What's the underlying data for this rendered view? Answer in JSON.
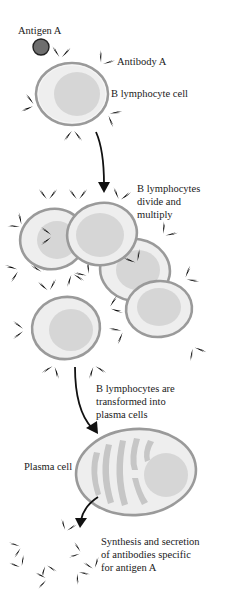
{
  "diagram": {
    "labels": {
      "antigen": "Antigen A",
      "antibody": "Antibody A",
      "b_cell": "B lymphocyte cell",
      "divide": [
        "B lymphocytes",
        "divide and",
        "multiply"
      ],
      "transform": [
        "B lymphocytes are",
        "transformed into",
        "plasma cells"
      ],
      "plasma_cell": "Plasma cell",
      "synthesis": [
        "Synthesis and secretion",
        "of antibodies specific",
        "for antigen A"
      ]
    },
    "stages": [
      {
        "name": "antigen-binding",
        "description": "Antigen A binds Antibody A on B lymphocyte cell"
      },
      {
        "name": "proliferation",
        "description": "B lymphocytes divide and multiply"
      },
      {
        "name": "differentiation",
        "description": "B lymphocytes are transformed into plasma cells"
      },
      {
        "name": "secretion",
        "description": "Synthesis and secretion of antibodies specific for antigen A"
      }
    ],
    "colors": {
      "antigen_fill": "#6e6e6e",
      "membrane": "#9a9a9a",
      "cytoplasm": "#eeeeee",
      "nucleus": "#d6d6d6",
      "antibody": "#b4b4b4",
      "arrow": "#111111",
      "text": "#1a1a1a"
    }
  }
}
